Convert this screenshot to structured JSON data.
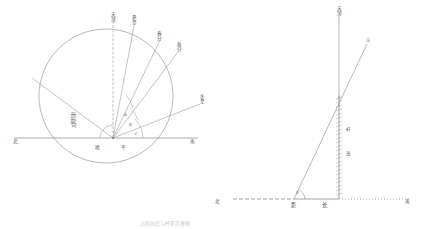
{
  "figure": {
    "caption": "太阳高度与杆影示意图"
  },
  "left_diagram": {
    "name": "celestial-sphere-solar-altitude",
    "center_label_left": "地",
    "center_label_right": "平",
    "horizon_west": "北",
    "horizon_east": "南",
    "diagonal_text": "太阳照射",
    "rays": [
      {
        "id": "zenith",
        "label_chars": [
          "天",
          "顶"
        ],
        "angle_deg": 90
      },
      {
        "id": "summer-solstice",
        "label_chars": [
          "夏",
          "至"
        ],
        "angle_deg": 78
      },
      {
        "id": "equinox",
        "label_chars": [
          "春",
          "分"
        ],
        "angle_deg": 62
      },
      {
        "id": "autumn",
        "label_chars": [
          "秋",
          "分"
        ],
        "angle_deg": 48
      },
      {
        "id": "winter-solstice",
        "label_chars": [
          "冬",
          "至"
        ],
        "angle_deg": 22
      }
    ],
    "angle_marks": [
      "a",
      "b",
      "c"
    ]
  },
  "right_diagram": {
    "name": "gnomon-shadow-triangle",
    "zenith_chars": [
      "天",
      "顶"
    ],
    "sun_symbol": "☉",
    "pole_chars": [
      "杆",
      "高"
    ],
    "shadow_label_left": "影",
    "shadow_label_right": "长",
    "angle_label": "h",
    "baseline_west": "北",
    "baseline_east": "南"
  },
  "colors": {
    "line": "#8a8a8a",
    "text": "#555555",
    "faint": "#b0b0b0"
  }
}
